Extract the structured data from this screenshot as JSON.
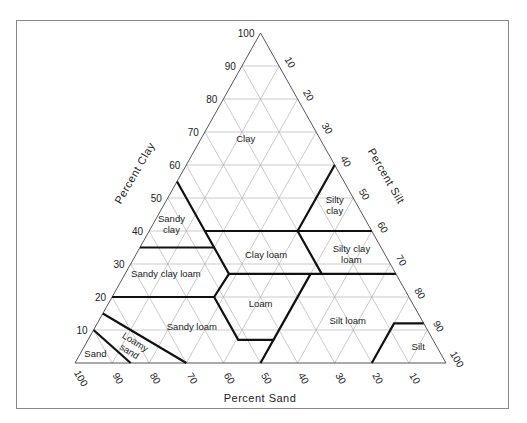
{
  "figure": {
    "colors": {
      "frame": "#888888",
      "grid": "#a8a8a8",
      "boundary": "#111111",
      "text": "#222222"
    }
  },
  "triangle": {
    "left": [
      75,
      363
    ],
    "right": [
      446,
      363
    ],
    "apex": [
      260.5,
      33
    ]
  },
  "axes": {
    "clay": {
      "title": "Percent Clay",
      "ticks": [
        "10",
        "20",
        "30",
        "40",
        "50",
        "60",
        "70",
        "80",
        "90",
        "100"
      ]
    },
    "silt": {
      "title": "Percent Silt",
      "ticks": [
        "10",
        "20",
        "30",
        "40",
        "50",
        "60",
        "70",
        "80",
        "90",
        "100"
      ]
    },
    "sand": {
      "title": "Percent Sand",
      "ticks": [
        "100",
        "90",
        "80",
        "70",
        "60",
        "50",
        "40",
        "30",
        "20",
        "10"
      ]
    }
  },
  "regions": [
    {
      "name": "Clay",
      "lines": [
        "Clay"
      ],
      "clay": 68,
      "sand": 20
    },
    {
      "name": "Silty clay",
      "lines": [
        "Silty",
        "clay"
      ],
      "clay": 48,
      "sand": 6
    },
    {
      "name": "Sandy clay",
      "lines": [
        "Sandy",
        "clay"
      ],
      "clay": 42,
      "sand": 53
    },
    {
      "name": "Clay loam",
      "lines": [
        "Clay  loam"
      ],
      "clay": 33,
      "sand": 32
    },
    {
      "name": "Silty clay loam",
      "lines": [
        "Silty  clay",
        "loam"
      ],
      "clay": 33,
      "sand": 9
    },
    {
      "name": "Sandy clay loam",
      "lines": [
        "Sandy  clay  loam"
      ],
      "clay": 27,
      "sand": 62
    },
    {
      "name": "Loam",
      "lines": [
        "Loam"
      ],
      "clay": 18,
      "sand": 41
    },
    {
      "name": "Silt loam",
      "lines": [
        "Silt  loam"
      ],
      "clay": 13,
      "sand": 20
    },
    {
      "name": "Sandy loam",
      "lines": [
        "Sandy  loam"
      ],
      "clay": 11,
      "sand": 63
    },
    {
      "name": "Loamy sand",
      "lines": [
        "Loamy",
        "sand"
      ],
      "clay": 5,
      "sand": 82,
      "rotate": 32
    },
    {
      "name": "Sand",
      "lines": [
        "Sand"
      ],
      "clay": 3,
      "sand": 93
    },
    {
      "name": "Silt",
      "lines": [
        "Silt"
      ],
      "clay": 5,
      "sand": 5
    }
  ],
  "chart_data": {
    "type": "ternary",
    "axes": [
      "Percent Clay",
      "Percent Silt",
      "Percent Sand"
    ],
    "range": [
      0,
      100
    ],
    "tick_step": 10,
    "boundaries_clay_sand": [
      [
        [
          10,
          90
        ],
        [
          0,
          85
        ]
      ],
      [
        [
          15,
          85
        ],
        [
          0,
          70
        ]
      ],
      [
        [
          20,
          80
        ],
        [
          20,
          52.5
        ],
        [
          7,
          52.5
        ],
        [
          7,
          43
        ],
        [
          0,
          50
        ]
      ],
      [
        [
          7,
          43
        ],
        [
          27,
          23
        ]
      ],
      [
        [
          35,
          65
        ],
        [
          35,
          45
        ]
      ],
      [
        [
          55,
          45
        ],
        [
          35,
          45
        ],
        [
          27,
          45
        ],
        [
          20,
          52.5
        ]
      ],
      [
        [
          27,
          45
        ],
        [
          27,
          0
        ]
      ],
      [
        [
          40,
          45
        ],
        [
          40,
          0
        ]
      ],
      [
        [
          60,
          0
        ],
        [
          40,
          20
        ],
        [
          27,
          20
        ]
      ],
      [
        [
          0,
          20
        ],
        [
          12,
          8
        ],
        [
          12,
          0
        ]
      ]
    ],
    "regions": [
      "Clay",
      "Silty clay",
      "Sandy clay",
      "Clay loam",
      "Silty clay loam",
      "Sandy clay loam",
      "Loam",
      "Silt loam",
      "Sandy loam",
      "Loamy sand",
      "Sand",
      "Silt"
    ]
  }
}
